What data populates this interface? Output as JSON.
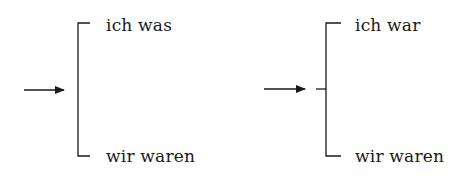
{
  "diagrams": [
    {
      "id": "left",
      "top_label": "ich was",
      "bottom_label": "wir waren",
      "has_stub": false
    },
    {
      "id": "right",
      "top_label": "ich war",
      "bottom_label": "wir waren",
      "has_stub": true
    }
  ],
  "colors": {
    "stroke": "#1a1a1a",
    "background": "#ffffff"
  }
}
